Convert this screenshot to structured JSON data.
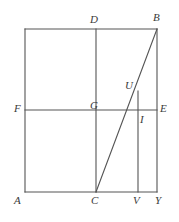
{
  "figure": {
    "type": "geometry-diagram",
    "colors": {
      "stroke": "#555555",
      "label": "#3a3a3a",
      "background": "#ffffff"
    },
    "stroke_width": 1.1,
    "canvas": {
      "width": 179,
      "height": 222
    },
    "points": [
      {
        "id": "A",
        "label": "A",
        "x": 25,
        "y": 192,
        "label_x": 14,
        "label_y": 195
      },
      {
        "id": "D",
        "label": "D",
        "x": 96,
        "y": 29,
        "label_x": 90,
        "label_y": 14
      },
      {
        "id": "B",
        "label": "B",
        "x": 157,
        "y": 29,
        "label_x": 153,
        "label_y": 12
      },
      {
        "id": "F",
        "label": "F",
        "x": 25,
        "y": 110,
        "label_x": 14,
        "label_y": 103
      },
      {
        "id": "G",
        "label": "G",
        "x": 96,
        "y": 110,
        "label_x": 90,
        "label_y": 100
      },
      {
        "id": "E",
        "label": "E",
        "x": 157,
        "y": 110,
        "label_x": 160,
        "label_y": 103
      },
      {
        "id": "U",
        "label": "U",
        "x": 138,
        "y": 91,
        "label_x": 125,
        "label_y": 80
      },
      {
        "id": "I",
        "label": "I",
        "x": 138,
        "y": 118,
        "label_x": 140,
        "label_y": 114
      },
      {
        "id": "C",
        "label": "C",
        "x": 96,
        "y": 192,
        "label_x": 91,
        "label_y": 195
      },
      {
        "id": "V",
        "label": "V",
        "x": 138,
        "y": 192,
        "label_x": 133,
        "label_y": 195
      },
      {
        "id": "Y",
        "label": "Y",
        "x": 157,
        "y": 192,
        "label_x": 155,
        "label_y": 195
      }
    ],
    "segments": [
      {
        "id": "top-edge",
        "name": "segment-top-edge",
        "x1": 25,
        "y1": 29,
        "x2": 157,
        "y2": 29
      },
      {
        "id": "bottom-edge",
        "name": "segment-bottom-edge",
        "x1": 25,
        "y1": 192,
        "x2": 157,
        "y2": 192
      },
      {
        "id": "left-edge",
        "name": "segment-left-edge",
        "x1": 25,
        "y1": 29,
        "x2": 25,
        "y2": 192
      },
      {
        "id": "right-edge",
        "name": "segment-right-edge",
        "x1": 157,
        "y1": 29,
        "x2": 157,
        "y2": 192
      },
      {
        "id": "vertical-DC",
        "name": "segment-vertical-d-c",
        "x1": 96,
        "y1": 29,
        "x2": 96,
        "y2": 192
      },
      {
        "id": "horizontal-FE",
        "name": "segment-horizontal-f-e",
        "x1": 25,
        "y1": 110,
        "x2": 157,
        "y2": 110
      },
      {
        "id": "diagonal-CB",
        "name": "segment-diagonal-c-b",
        "x1": 96,
        "y1": 192,
        "x2": 157,
        "y2": 29
      },
      {
        "id": "vertical-UV",
        "name": "segment-vertical-u-v",
        "x1": 138,
        "y1": 91,
        "x2": 138,
        "y2": 192
      }
    ]
  }
}
